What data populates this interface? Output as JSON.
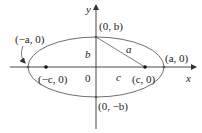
{
  "diagram": {
    "type": "ellipse-foci",
    "axes": {
      "x_label": "x",
      "y_label": "y"
    },
    "labels": {
      "origin": "0",
      "vertex_left": "(−a, 0)",
      "vertex_right": "(a, 0)",
      "covertex_top": "(0, b)",
      "covertex_bottom": "(0, −b)",
      "focus_left": "(−c, 0)",
      "focus_right": "(c, 0)",
      "segment_a": "a",
      "segment_b": "b",
      "segment_c": "c"
    },
    "colors": {
      "ellipse": "#6f6f6f",
      "axes": "#333333",
      "points": "#111111",
      "text": "#222222"
    }
  }
}
